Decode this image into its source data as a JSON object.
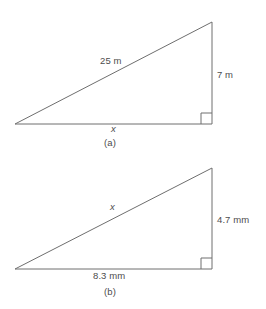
{
  "figure": {
    "stroke_color": "#6e6e6e",
    "text_color": "#4d4d4d",
    "background": "#ffffff"
  },
  "diagrams": [
    {
      "caption": "(a)",
      "unit": "m",
      "hypotenuse_label": "25 m",
      "vertical_label": "7 m",
      "base_label": "x",
      "right_angle_marker": true,
      "vertices": {
        "left": [
          15,
          124
        ],
        "bottom_right": [
          212,
          124
        ],
        "apex": [
          212,
          22
        ]
      }
    },
    {
      "caption": "(b)",
      "unit": "mm",
      "hypotenuse_label": "x",
      "vertical_label": "4.7 mm",
      "base_label": "8.3 mm",
      "right_angle_marker": true,
      "vertices": {
        "left": [
          15,
          269
        ],
        "bottom_right": [
          212,
          269
        ],
        "apex": [
          212,
          168
        ]
      }
    }
  ]
}
